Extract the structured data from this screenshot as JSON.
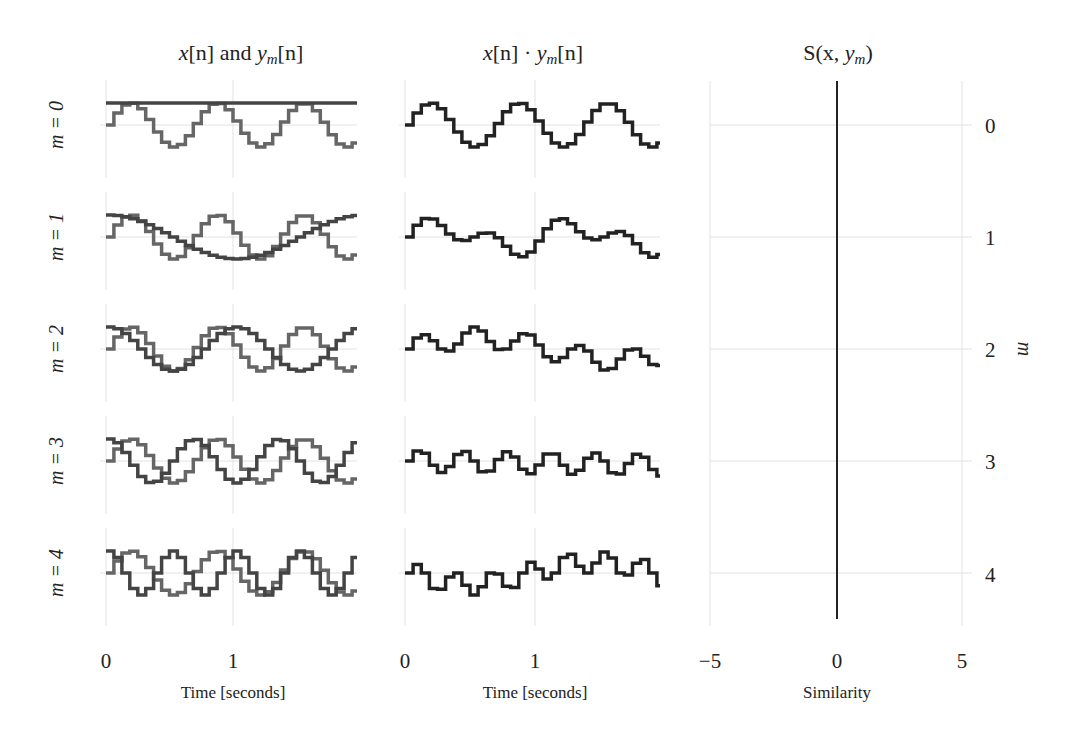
{
  "chart_data": [
    {
      "type": "line",
      "title": "x[n] and y_m[n]",
      "title_parts": {
        "a": "x",
        "b": "[n] and ",
        "c": "y",
        "sub": "m",
        "d": "[n]"
      },
      "xlabel": "Time [seconds]",
      "x_ticks": [
        "0",
        "1"
      ],
      "xlim": [
        0,
        1.98
      ],
      "rows": [
        "m = 0",
        "m = 1",
        "m = 2",
        "m = 3",
        "m = 4"
      ],
      "sample_rate_hz": 16,
      "series": [
        {
          "name": "x[n]",
          "kind": "stepped sine",
          "frequency_hz": 1.47,
          "amplitude": 1,
          "color": "#666666"
        },
        {
          "name": "y_m[n]",
          "kind": "stepped cosine",
          "frequency_hz_by_m": [
            0,
            0.5,
            1.0,
            1.5,
            2.0
          ],
          "amplitude": 1,
          "color": "#444444"
        }
      ],
      "grid": true
    },
    {
      "type": "line",
      "title": "x[n] · y_m[n]",
      "title_parts": {
        "a": "x",
        "b": "[n] · ",
        "c": "y",
        "sub": "m",
        "d": "[n]"
      },
      "xlabel": "Time [seconds]",
      "x_ticks": [
        "0",
        "1"
      ],
      "xlim": [
        0,
        1.98
      ],
      "series": [
        {
          "name": "x[n]·y_m[n]",
          "kind": "product of stepped signals",
          "color": "#222222"
        }
      ],
      "grid": true
    },
    {
      "type": "bar",
      "orientation": "horizontal",
      "title": "S(x, y_m)",
      "title_parts": {
        "a": "S(x, ",
        "c": "y",
        "sub": "m",
        "d": ")"
      },
      "xlabel": "Similarity",
      "ylabel": "m",
      "x_ticks": [
        "−5",
        "0",
        "5"
      ],
      "xlim": [
        -5,
        5
      ],
      "categories": [
        "0",
        "1",
        "2",
        "3",
        "4"
      ],
      "values": [
        0,
        0,
        0,
        0,
        0
      ],
      "zero_line_color": "#222222",
      "grid": true
    }
  ],
  "labels": {
    "rows": [
      "m = 0",
      "m = 1",
      "m = 2",
      "m = 3",
      "m = 4"
    ],
    "right_ticks": [
      "0",
      "1",
      "2",
      "3",
      "4"
    ],
    "right_axis_label": "m"
  }
}
